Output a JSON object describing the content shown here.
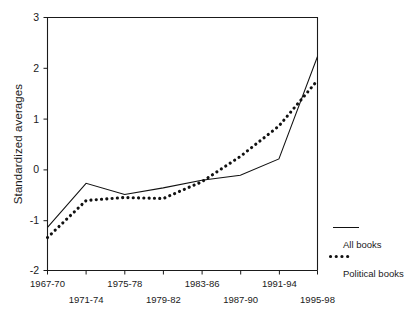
{
  "chart_data": {
    "type": "line",
    "title": "",
    "xlabel": "",
    "ylabel": "Standardized averages",
    "categories": [
      "1967-70",
      "1971-74",
      "1975-78",
      "1979-82",
      "1983-86",
      "1987-90",
      "1991-94",
      "1995-98"
    ],
    "xtick_labels_row1": [
      "1967-70",
      "1975-78",
      "1983-86",
      "1991-94"
    ],
    "xtick_labels_row2": [
      "1971-74",
      "1979-82",
      "1987-90",
      "1995-98"
    ],
    "ylim": [
      -2,
      3
    ],
    "ytick_labels": [
      "3",
      "2",
      "1",
      "0",
      "-1",
      "-2"
    ],
    "ytick_values": [
      3,
      2,
      1,
      0,
      -1,
      -2
    ],
    "grid": false,
    "legend_position": "right",
    "series": [
      {
        "name": "All books",
        "style": "solid",
        "color": "#111111",
        "values": [
          -1.15,
          -0.28,
          -0.5,
          -0.37,
          -0.22,
          -0.12,
          0.2,
          2.22
        ]
      },
      {
        "name": "Political books",
        "style": "dotted",
        "color": "#111111",
        "values": [
          -1.35,
          -0.62,
          -0.56,
          -0.58,
          -0.25,
          0.25,
          0.85,
          1.75
        ]
      }
    ],
    "legend_entries": [
      {
        "label": "All books",
        "style": "solid"
      },
      {
        "label": "Political books",
        "style": "dotted"
      }
    ]
  },
  "axes": {
    "y_axis_label": "Standardized averages"
  }
}
